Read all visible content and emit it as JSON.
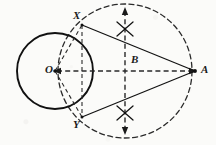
{
  "figure": {
    "background_color": "#fbfbf9",
    "ink_color": "#1a1a1a",
    "width": 216,
    "height": 145
  },
  "labels": {
    "center": "O",
    "midpoint": "B",
    "external_point": "A",
    "tangent_upper": "X",
    "tangent_lower": "Y"
  },
  "label_positions": {
    "center": {
      "x": 45,
      "y": 64
    },
    "midpoint": {
      "x": 131,
      "y": 54
    },
    "external_point": {
      "x": 201,
      "y": 64
    },
    "tangent_upper": {
      "x": 73,
      "y": 10
    },
    "tangent_lower": {
      "x": 73,
      "y": 119
    }
  },
  "geometry": {
    "solid_circle": {
      "cx": 55,
      "cy": 71,
      "r": 38,
      "style": "solid",
      "stroke_width": 1.7
    },
    "dashed_circle": {
      "cx": 125,
      "cy": 71,
      "r": 67,
      "style": "dashed",
      "stroke_width": 1.3
    },
    "points": {
      "O": {
        "x": 55,
        "y": 71
      },
      "B": {
        "x": 125,
        "y": 71
      },
      "A": {
        "x": 195,
        "y": 71
      },
      "X": {
        "x": 82,
        "y": 25
      },
      "Y": {
        "x": 82,
        "y": 117
      }
    },
    "segments": [
      {
        "name": "tangent-AX",
        "from": "X",
        "to": "A",
        "style": "solid"
      },
      {
        "name": "tangent-AY",
        "from": "Y",
        "to": "A",
        "style": "solid"
      },
      {
        "name": "radius-OX",
        "from": "O",
        "to": "X",
        "style": "dashed"
      },
      {
        "name": "radius-OY",
        "from": "O",
        "to": "Y",
        "style": "dashed"
      },
      {
        "name": "chord-XY",
        "from": "X",
        "to": "Y",
        "style": "dashed"
      },
      {
        "name": "axis-OA",
        "from": "O",
        "to": "A",
        "style": "dashed",
        "arrows": "both"
      },
      {
        "name": "perpendicular-bisector",
        "from": "top",
        "to": "bottom",
        "style": "dashed",
        "arrows": "both"
      }
    ],
    "arc_marks": [
      {
        "name": "arc-cross-upper",
        "x": 125,
        "y": 29
      },
      {
        "name": "arc-cross-lower",
        "x": 125,
        "y": 113
      }
    ]
  }
}
